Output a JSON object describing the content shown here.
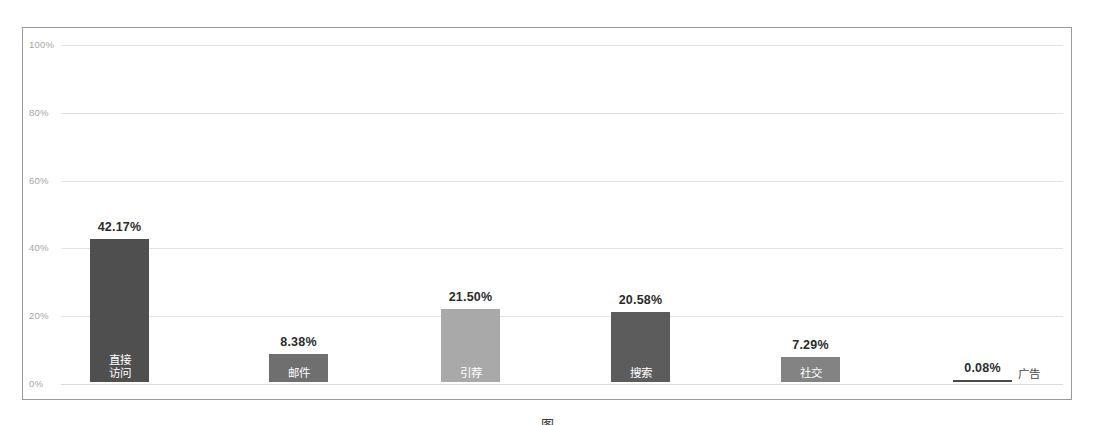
{
  "chart_data": {
    "type": "bar",
    "title": "",
    "subtitle": "",
    "xlabel": "",
    "ylabel": "",
    "ylim": [
      0,
      100
    ],
    "yticks": [
      "0%",
      "20%",
      "40%",
      "60%",
      "80%",
      "100%"
    ],
    "ytick_values": [
      0,
      20,
      40,
      60,
      80,
      100
    ],
    "grid": true,
    "legend": "none",
    "categories": [
      "直接\n访问",
      "邮件",
      "引荐",
      "搜索",
      "社交",
      "广告"
    ],
    "values": [
      42.17,
      8.38,
      21.5,
      20.58,
      7.29,
      0.08
    ],
    "value_labels": [
      "42.17%",
      "8.38%",
      "21.50%",
      "20.58%",
      "7.29%",
      "0.08%"
    ],
    "bars": [
      {
        "category_line1": "直接",
        "category_line2": "访问",
        "category_full": "直接访问",
        "value": 42.17,
        "value_label": "42.17%",
        "color": "#4f4f4f",
        "label_position": "inside"
      },
      {
        "category_line1": "邮件",
        "category_line2": "",
        "category_full": "邮件",
        "value": 8.38,
        "value_label": "8.38%",
        "color": "#6f6f6f",
        "label_position": "inside"
      },
      {
        "category_line1": "引荐",
        "category_line2": "",
        "category_full": "引荐",
        "value": 21.5,
        "value_label": "21.50%",
        "color": "#a9a9a9",
        "label_position": "inside"
      },
      {
        "category_line1": "搜索",
        "category_line2": "",
        "category_full": "搜索",
        "value": 20.58,
        "value_label": "20.58%",
        "color": "#5c5c5c",
        "label_position": "inside"
      },
      {
        "category_line1": "社交",
        "category_line2": "",
        "category_full": "社交",
        "value": 7.29,
        "value_label": "7.29%",
        "color": "#838383",
        "label_position": "inside"
      },
      {
        "category_line1": "广告",
        "category_line2": "",
        "category_full": "广告",
        "value": 0.08,
        "value_label": "0.08%",
        "color": "#4a4a4a",
        "label_position": "outside"
      }
    ]
  },
  "caption": {
    "fragment": "图"
  },
  "colors": {
    "frame_border": "#9a9a9a",
    "gridline": "#e2e2e2",
    "ytick_text": "#a6a6a6",
    "value_text": "#2b2b2b",
    "bar_inside_text": "#ffffff",
    "background": "#ffffff"
  }
}
